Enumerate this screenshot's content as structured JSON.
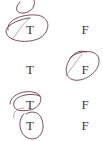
{
  "document": {
    "type": "true-false answer sheet (scanned, handwritten marks)",
    "ink_color": "#6b3a4a",
    "rows": [
      {
        "true_label": "",
        "false_label": "",
        "circled": "T",
        "partial": true
      },
      {
        "true_label": "T",
        "false_label": "F",
        "circled": "T"
      },
      {
        "true_label": "T",
        "false_label": "F",
        "circled": "F"
      },
      {
        "true_label": "T",
        "false_label": "F",
        "circled": "T"
      },
      {
        "true_label": "T",
        "false_label": "F",
        "circled": "T"
      }
    ]
  }
}
